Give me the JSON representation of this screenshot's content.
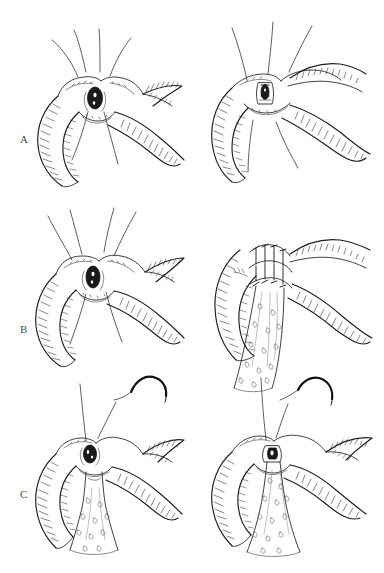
{
  "plate": {
    "title": "Surgical anastomosis technique plate",
    "description": "Three-row, two-column pen-and-ink surgical illustration showing sequential steps of a duct-to-bowel anastomosis.",
    "background_color": "#ffffff",
    "ink_color": "#1d1d1d",
    "width": 384,
    "height": 573
  },
  "labels": {
    "a": "A",
    "b": "B",
    "c": "C"
  },
  "panels": [
    {
      "id": "a-left",
      "row_label": "A",
      "column": "left",
      "caption": "Stay sutures placed around the duct orifice before approximation",
      "features": [
        "duct-orifice",
        "stay-sutures",
        "bowel-loop",
        "serosal-hatching"
      ]
    },
    {
      "id": "a-right",
      "row_label": "A",
      "column": "right",
      "caption": "Posterior row approximated, orifice drawn into the enterotomy",
      "features": [
        "duct-orifice",
        "approximated-wall",
        "bowel-loop",
        "serosal-hatching"
      ]
    },
    {
      "id": "b-left",
      "row_label": "B",
      "column": "left",
      "caption": "Traction sutures elevate the duct orifice for anastomosis",
      "features": [
        "duct-orifice",
        "stay-sutures",
        "bowel-loop",
        "serosal-hatching"
      ]
    },
    {
      "id": "b-right",
      "row_label": "B",
      "column": "right",
      "caption": "Completed interrupted suture line with conduit drawn through",
      "features": [
        "interrupted-stitches",
        "conduit",
        "bowel-loop",
        "serosal-hatching"
      ]
    },
    {
      "id": "c-left",
      "row_label": "C",
      "column": "left",
      "caption": "Curved needle placed for the anterior suture row over the conduit",
      "features": [
        "curved-needle",
        "suture-thread",
        "duct-orifice",
        "conduit"
      ]
    },
    {
      "id": "c-right",
      "row_label": "C",
      "column": "right",
      "caption": "Anterior row completed, conduit seated within the anastomosis",
      "features": [
        "curved-needle",
        "suture-thread",
        "conduit",
        "bowel-loop"
      ]
    }
  ],
  "legend": {
    "ink_style": "pen-and-ink line drawing with directional hatching",
    "rows": 3,
    "columns": 2
  }
}
